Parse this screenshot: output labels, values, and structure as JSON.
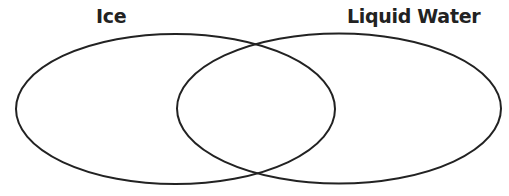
{
  "diagram": {
    "type": "venn",
    "sets": [
      {
        "id": "a",
        "label": "Ice",
        "region_text": []
      },
      {
        "id": "b",
        "label": "Liquid Water",
        "region_text": []
      }
    ],
    "overlap": {
      "label": "",
      "region_text": []
    },
    "colors": {
      "outline": "#222222",
      "text": "#222222",
      "background": "#ffffff"
    }
  }
}
